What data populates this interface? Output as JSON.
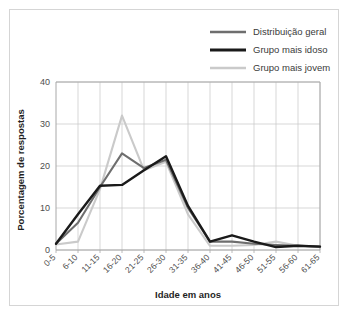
{
  "chart_data": {
    "type": "line",
    "title": "",
    "xlabel": "Idade em anos",
    "ylabel": "Porcentagem de respostas",
    "categories": [
      "0-5",
      "6-10",
      "11-15",
      "16-20",
      "21-25",
      "26-30",
      "31-35",
      "36-40",
      "41-45",
      "46-50",
      "51-55",
      "56-60",
      "61-65"
    ],
    "ylim": [
      0,
      40
    ],
    "yticks": [
      0,
      10,
      20,
      30,
      40
    ],
    "ytick_labels": [
      "0",
      "10",
      "20",
      "30",
      "40"
    ],
    "grid": true,
    "legend_position": "top-right",
    "series": [
      {
        "name": "Distribuição geral",
        "color": "#6e6e6e",
        "width": 2.1,
        "values": [
          1.5,
          6.5,
          15.0,
          23.0,
          19.5,
          21.5,
          10.0,
          2.0,
          2.0,
          1.5,
          1.2,
          1.0,
          0.8
        ]
      },
      {
        "name": "Grupo mais idoso",
        "color": "#1a1a1a",
        "width": 2.4,
        "values": [
          1.5,
          8.5,
          15.3,
          15.5,
          19.0,
          22.3,
          10.5,
          2.0,
          3.5,
          2.0,
          0.7,
          1.0,
          0.8
        ]
      },
      {
        "name": "Grupo mais jovem",
        "color": "#cacaca",
        "width": 2.1,
        "values": [
          1.3,
          2.0,
          14.5,
          32.0,
          19.0,
          21.0,
          8.5,
          1.0,
          1.0,
          1.2,
          2.0,
          1.0,
          0.8
        ]
      }
    ]
  },
  "legend": {
    "items": [
      {
        "label": "Distribuição geral"
      },
      {
        "label": "Grupo mais idoso"
      },
      {
        "label": "Grupo mais jovem"
      }
    ]
  },
  "axes": {
    "x_title": "Idade em anos",
    "y_title": "Porcentagem de respostas"
  }
}
